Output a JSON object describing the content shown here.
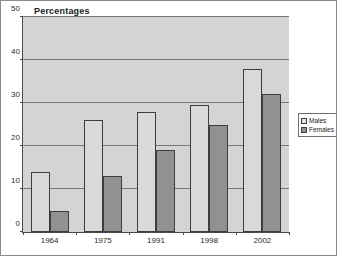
{
  "chart_data": {
    "type": "bar",
    "title": "Percentages",
    "xlabel": "",
    "ylabel": "",
    "categories": [
      "1964",
      "1975",
      "1991",
      "1998",
      "2002"
    ],
    "series": [
      {
        "name": "Males",
        "color": "#d9d9d9",
        "values": [
          14,
          26,
          28,
          29.5,
          38
        ]
      },
      {
        "name": "Females",
        "color": "#919191",
        "values": [
          5,
          13,
          19,
          25,
          32
        ]
      }
    ],
    "ylim": [
      0,
      50
    ],
    "yticks": [
      0,
      10,
      20,
      30,
      40,
      50
    ],
    "ytick_labels": [
      "0",
      "10",
      "20",
      "30",
      "40",
      "50"
    ],
    "grid": true,
    "legend_position": "right"
  },
  "legend": {
    "items": [
      {
        "label": "Males"
      },
      {
        "label": "Females"
      }
    ]
  }
}
